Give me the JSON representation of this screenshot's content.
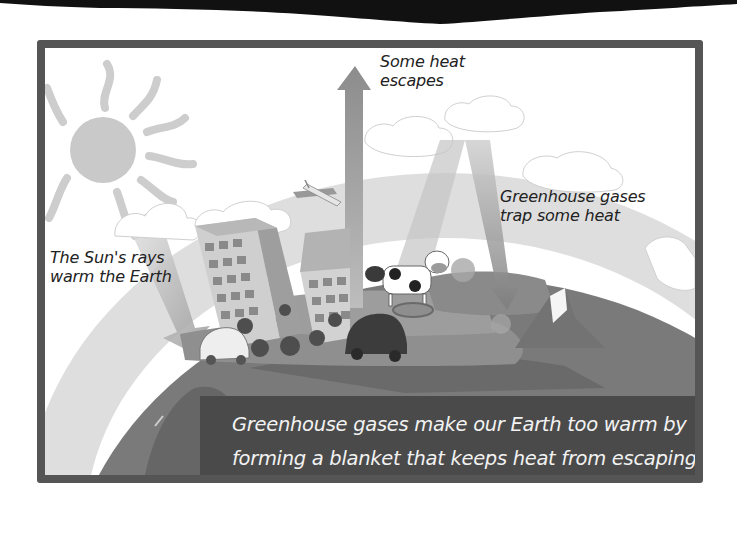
{
  "diagram": {
    "labels": {
      "heat_escapes": [
        "Some heat",
        "escapes"
      ],
      "gases_trap": [
        "Greenhouse gases",
        "trap some heat"
      ],
      "sun_rays": [
        "The Sun's rays",
        "warm the Earth"
      ]
    },
    "caption": [
      "Greenhouse gases make our Earth too warm by",
      "forming a blanket that keeps heat from escaping."
    ],
    "elements": [
      "sun-icon",
      "atmosphere-band",
      "cloud-icon",
      "earth-globe",
      "building-icon",
      "car-icon",
      "airplane-icon",
      "cow-icon",
      "pig-icon",
      "sun-ray-arrow",
      "escape-arrow",
      "trapped-heat-arrow"
    ],
    "colors": {
      "frame": "#555555",
      "caption_bg": "#4a4a4a",
      "caption_text": "#f2f2f2",
      "label_text": "#222222",
      "sun": "#c8c8c8",
      "atmosphere": "#dcdcdc",
      "earth": "#7a7a7a"
    }
  }
}
